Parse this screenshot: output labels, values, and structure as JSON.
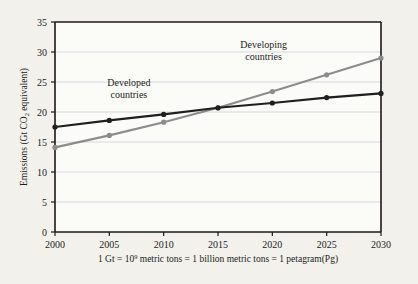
{
  "chart_data": {
    "type": "line",
    "title": "",
    "xlabel": "",
    "ylabel": "Emissions (Gt CO2 equivalent)",
    "ylabel_parts": {
      "before": "Emissions (Gt CO",
      "sub": "2",
      "after": " equivalent)"
    },
    "x": [
      2000,
      2005,
      2010,
      2015,
      2020,
      2025,
      2030
    ],
    "categories": [
      "2000",
      "2005",
      "2010",
      "2015",
      "2020",
      "2025",
      "2030"
    ],
    "xlim": [
      2000,
      2030
    ],
    "ylim": [
      0,
      35
    ],
    "yticks": [
      0,
      5,
      10,
      15,
      20,
      25,
      30,
      35
    ],
    "ytick_labels": [
      "0",
      "5",
      "10",
      "15",
      "20",
      "25",
      "30",
      "35"
    ],
    "grid": true,
    "grid_axis": "y",
    "legend_position": "inline-annotations",
    "series": [
      {
        "name": "Developed countries",
        "color": "#1f1f1f",
        "values": [
          17.5,
          18.6,
          19.6,
          20.7,
          21.5,
          22.4,
          23.1
        ]
      },
      {
        "name": "Developing countries",
        "color": "#8c8c8c",
        "values": [
          14.1,
          16.1,
          18.3,
          20.7,
          23.4,
          26.2,
          29.0
        ]
      }
    ],
    "annotations": [
      {
        "name": "developed-countries-label",
        "line1": "Developed",
        "line2": "countries",
        "x": 2006.8,
        "y": 24.3
      },
      {
        "name": "developing-countries-label",
        "line1": "Developing",
        "line2": "countries",
        "x": 2019.2,
        "y": 30.6
      }
    ],
    "caption": {
      "full": "1 Gt = 10^9 metric tons = 1 billion metric tons = 1 petagram(Pg)",
      "before": "1 Gt = 10",
      "sup": "9",
      "after": " metric tons = 1 billion metric tons = 1 petagram(Pg)"
    }
  },
  "colors": {
    "background": "#f2f1ec",
    "plot_background": "#fbfbf8",
    "axis": "#1a1a1a",
    "grid": "#cfcfcf",
    "developed": "#1f1f1f",
    "developing": "#8c8c8c"
  }
}
